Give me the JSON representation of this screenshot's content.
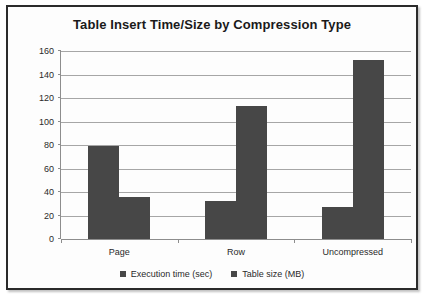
{
  "chart_data": {
    "type": "bar",
    "title": "Table Insert Time/Size by Compression Type",
    "categories": [
      "Page",
      "Row",
      "Uncompressed"
    ],
    "series": [
      {
        "name": "Execution time (sec)",
        "color": "#474747",
        "values": [
          79,
          32,
          27
        ]
      },
      {
        "name": "Table size (MB)",
        "color": "#474747",
        "values": [
          36,
          113,
          152
        ]
      }
    ],
    "xlabel": "",
    "ylabel": "",
    "ylim": [
      0,
      160
    ],
    "ytick_step": 20,
    "yticks": [
      0,
      20,
      40,
      60,
      80,
      100,
      120,
      140,
      160
    ],
    "ytick_labels": [
      "0",
      "20",
      "40",
      "60",
      "80",
      "100",
      "120",
      "140",
      "160"
    ],
    "grid": true,
    "grid_axis": "y",
    "legend_position": "bottom",
    "plot_background": "#ffffff",
    "grid_color": "#a6a6a6",
    "axis_color": "#8d8d8d",
    "border_color": "#2b2b2b"
  }
}
